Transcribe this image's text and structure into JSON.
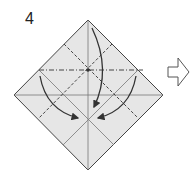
{
  "diagram": {
    "step_number": "4",
    "paper_color": "#e6e6e6",
    "line_color": "#555555",
    "arrow_color": "#333333",
    "elements": {
      "paper": "square paper rotated as diamond",
      "mountain_fold": "horizontal dash-dot line",
      "valley_folds": "two diagonal dashed lines",
      "fold_arrows": 3,
      "next_step_arrow": "outlined right arrow"
    }
  }
}
